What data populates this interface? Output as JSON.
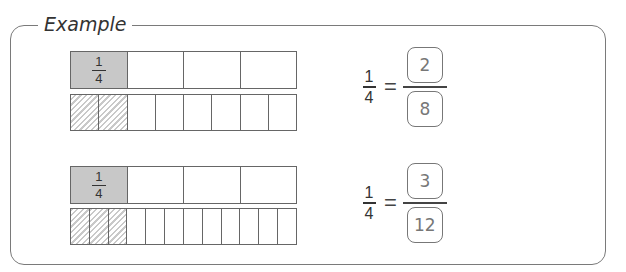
{
  "title": "Example",
  "colors": {
    "border": "#7a7a7a",
    "shaded": "#c8c8c8",
    "hatch": "#c9c9c9",
    "answer_text": "#777777"
  },
  "examples": [
    {
      "whole_bar": {
        "parts": 4,
        "shaded_parts": 1,
        "shaded_label": {
          "numerator": "1",
          "denominator": "4"
        }
      },
      "split_bar": {
        "parts": 8,
        "hatched_parts": 2
      },
      "equation": {
        "lhs": {
          "numerator": "1",
          "denominator": "4"
        },
        "equals": "=",
        "rhs": {
          "numerator": "2",
          "denominator": "8"
        }
      }
    },
    {
      "whole_bar": {
        "parts": 4,
        "shaded_parts": 1,
        "shaded_label": {
          "numerator": "1",
          "denominator": "4"
        }
      },
      "split_bar": {
        "parts": 12,
        "hatched_parts": 3
      },
      "equation": {
        "lhs": {
          "numerator": "1",
          "denominator": "4"
        },
        "equals": "=",
        "rhs": {
          "numerator": "3",
          "denominator": "12"
        }
      }
    }
  ]
}
